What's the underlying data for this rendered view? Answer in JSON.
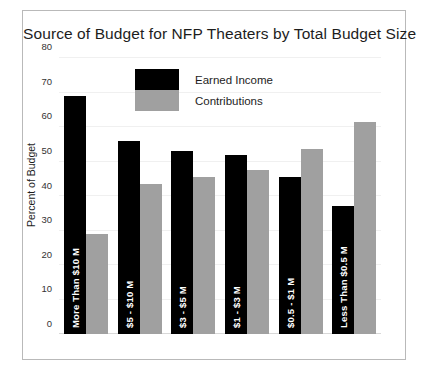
{
  "chart_data": {
    "type": "bar",
    "title": "Source of Budget for NFP Theaters by Total Budget Size",
    "xlabel": "",
    "ylabel": "Percent of Budget",
    "ylim": [
      0,
      80
    ],
    "yticks": [
      0,
      10,
      20,
      30,
      40,
      50,
      60,
      70,
      80
    ],
    "grid": false,
    "legend_position": "top-center",
    "categories": [
      "More Than $10 M",
      "$5 - $10 M",
      "$3 - $5 M",
      "$1 - $3 M",
      "$0.5 - $1 M",
      "Less Than $0.5 M"
    ],
    "series": [
      {
        "name": "Earned Income",
        "color": "#000000",
        "values": [
          69,
          56,
          53,
          52,
          45.5,
          37
        ]
      },
      {
        "name": "Contributions",
        "color": "#a0a0a0",
        "values": [
          29,
          43.5,
          45.5,
          47.5,
          53.5,
          61.5
        ]
      }
    ]
  },
  "legend": {
    "items": [
      {
        "label": "Earned Income"
      },
      {
        "label": "Contributions"
      }
    ]
  }
}
